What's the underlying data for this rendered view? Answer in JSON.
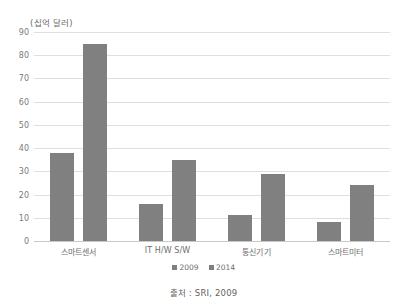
{
  "chart_data": {
    "type": "bar",
    "title": "",
    "subtitle": "",
    "xlabel": "",
    "ylabel": "(십억 달러)",
    "unit_label": "(십억 달러)",
    "categories": [
      "스마트센서",
      "IT H/W S/W",
      "통신기기",
      "스마트미터"
    ],
    "series": [
      {
        "name": "2009",
        "values": [
          38,
          16,
          11,
          8
        ],
        "color": "#808080"
      },
      {
        "name": "2014",
        "values": [
          85,
          35,
          29,
          24
        ],
        "color": "#808080"
      }
    ],
    "ylim": [
      0,
      90
    ],
    "ystep": 10,
    "yticks": [
      "90",
      "80",
      "70",
      "60",
      "50",
      "40",
      "30",
      "20",
      "10",
      "0"
    ],
    "grid": true,
    "legend_position": "bottom",
    "legend": [
      "2009",
      "2014"
    ],
    "annotations": [
      "출처 : SRI, 2009"
    ]
  },
  "caption": {
    "source": "출처 : SRI, 2009"
  },
  "colors": {
    "bar": "#808080",
    "gridline": "#dfdfdf",
    "baseline": "#c9c9c9",
    "text": "#6e6e6e",
    "background": "#ffffff"
  }
}
